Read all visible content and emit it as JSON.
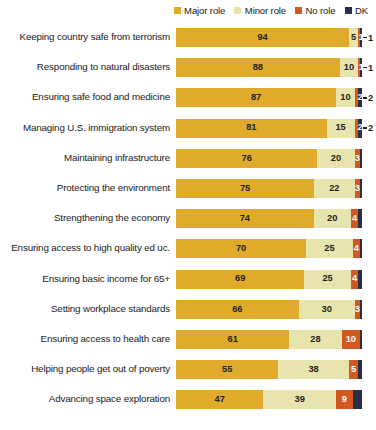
{
  "legend": {
    "items": [
      {
        "label": "Major role",
        "color": "#e0aa2a",
        "swatch_name": "legend-swatch-major-role"
      },
      {
        "label": "Minor role",
        "color": "#e8e4ad",
        "swatch_name": "legend-swatch-minor-role"
      },
      {
        "label": "No role",
        "color": "#d1581f",
        "swatch_name": "legend-swatch-no-role"
      },
      {
        "label": "DK",
        "color": "#2b2f45",
        "swatch_name": "legend-swatch-dk"
      }
    ]
  },
  "chart_data": {
    "type": "bar",
    "orientation": "horizontal",
    "stacked": true,
    "title": "",
    "subtitle": "",
    "xlabel": "",
    "ylabel": "",
    "xlim": [
      0,
      100
    ],
    "grid": false,
    "legend_position": "top-right",
    "value_unit": "percent",
    "colors": {
      "major_role": "#e0aa2a",
      "minor_role": "#e8e4ad",
      "no_role": "#d1581f",
      "dk": "#2b2f45"
    },
    "categories": [
      "Keeping country safe from terrorism",
      "Responding to natural disasters",
      "Ensuring safe food and medicine",
      "Managing U.S. immigration system",
      "Maintaining infrastructure",
      "Protecting the environment",
      "Strengthening the economy",
      "Ensuring access to high quality ed uc.",
      "Ensuring basic income for 65+",
      "Setting workplace standards",
      "Ensuring access to health care",
      "Helping people get out of poverty",
      "Advancing space exploration"
    ],
    "series": [
      {
        "name": "Major role",
        "key": "major_role",
        "values": [
          94,
          88,
          87,
          81,
          76,
          75,
          74,
          70,
          69,
          66,
          61,
          55,
          47
        ]
      },
      {
        "name": "Minor role",
        "key": "minor_role",
        "values": [
          5,
          10,
          10,
          15,
          20,
          22,
          20,
          25,
          25,
          30,
          28,
          38,
          39
        ]
      },
      {
        "name": "No role",
        "key": "no_role",
        "values": [
          1,
          1,
          2,
          2,
          3,
          3,
          4,
          4,
          4,
          3,
          10,
          5,
          9
        ]
      },
      {
        "name": "DK",
        "key": "dk",
        "values": [
          1,
          1,
          2,
          2,
          1,
          1,
          2,
          1,
          2,
          1,
          1,
          2,
          5
        ]
      }
    ],
    "rows": [
      {
        "label": "Keeping country safe from terrorism",
        "major_role": 94,
        "minor_role": 5,
        "no_role": 1,
        "dk": 1,
        "major_label": "94",
        "minor_label": "5",
        "no_role_label": "",
        "dk_label": "1",
        "dk_callout": true
      },
      {
        "label": "Responding to natural disasters",
        "major_role": 88,
        "minor_role": 10,
        "no_role": 1,
        "dk": 1,
        "major_label": "88",
        "minor_label": "10",
        "no_role_label": "",
        "dk_label": "1",
        "dk_callout": true
      },
      {
        "label": "Ensuring safe food and medicine",
        "major_role": 87,
        "minor_role": 10,
        "no_role": 2,
        "dk": 2,
        "major_label": "87",
        "minor_label": "10",
        "no_role_label": "",
        "dk_label": "2",
        "dk_callout": true
      },
      {
        "label": "Managing U.S. immigration system",
        "major_role": 81,
        "minor_role": 15,
        "no_role": 2,
        "dk": 2,
        "major_label": "81",
        "minor_label": "15",
        "no_role_label": "",
        "dk_label": "2",
        "dk_callout": true
      },
      {
        "label": "Maintaining infrastructure",
        "major_role": 76,
        "minor_role": 20,
        "no_role": 3,
        "dk": 1,
        "major_label": "76",
        "minor_label": "20",
        "no_role_label": "3",
        "dk_label": "",
        "dk_callout": false
      },
      {
        "label": "Protecting the environment",
        "major_role": 75,
        "minor_role": 22,
        "no_role": 3,
        "dk": 1,
        "major_label": "75",
        "minor_label": "22",
        "no_role_label": "3",
        "dk_label": "",
        "dk_callout": false
      },
      {
        "label": "Strengthening the economy",
        "major_role": 74,
        "minor_role": 20,
        "no_role": 4,
        "dk": 2,
        "major_label": "74",
        "minor_label": "20",
        "no_role_label": "4",
        "dk_label": "",
        "dk_callout": false
      },
      {
        "label": "Ensuring access to high quality ed uc.",
        "major_role": 70,
        "minor_role": 25,
        "no_role": 4,
        "dk": 1,
        "major_label": "70",
        "minor_label": "25",
        "no_role_label": "4",
        "dk_label": "",
        "dk_callout": false
      },
      {
        "label": "Ensuring basic income for 65+",
        "major_role": 69,
        "minor_role": 25,
        "no_role": 4,
        "dk": 2,
        "major_label": "69",
        "minor_label": "25",
        "no_role_label": "4",
        "dk_label": "",
        "dk_callout": false
      },
      {
        "label": "Setting workplace standards",
        "major_role": 66,
        "minor_role": 30,
        "no_role": 3,
        "dk": 1,
        "major_label": "66",
        "minor_label": "30",
        "no_role_label": "3",
        "dk_label": "",
        "dk_callout": false
      },
      {
        "label": "Ensuring access to health care",
        "major_role": 61,
        "minor_role": 28,
        "no_role": 10,
        "dk": 1,
        "major_label": "61",
        "minor_label": "28",
        "no_role_label": "10",
        "dk_label": "",
        "dk_callout": false
      },
      {
        "label": "Helping people get out of poverty",
        "major_role": 55,
        "minor_role": 38,
        "no_role": 5,
        "dk": 2,
        "major_label": "55",
        "minor_label": "38",
        "no_role_label": "5",
        "dk_label": "",
        "dk_callout": false
      },
      {
        "label": "Advancing space exploration",
        "major_role": 47,
        "minor_role": 39,
        "no_role": 9,
        "dk": 5,
        "major_label": "47",
        "minor_label": "39",
        "no_role_label": "9",
        "dk_label": "",
        "dk_callout": false
      }
    ]
  }
}
